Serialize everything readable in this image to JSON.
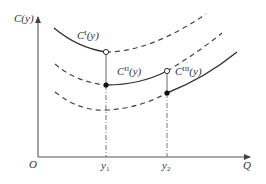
{
  "diagram": {
    "colors": {
      "axis": "#444444",
      "curve": "#333333",
      "background": "#ffffff"
    },
    "axes": {
      "y_label_main": "C",
      "y_label_arg": "(y)",
      "x_label": "Q",
      "origin_label": "O"
    },
    "ticks": [
      {
        "base": "y",
        "sub": "1"
      },
      {
        "base": "y",
        "sub": "2"
      }
    ],
    "curves": [
      {
        "base": "C",
        "sup": "I",
        "arg": "(y)"
      },
      {
        "base": "C",
        "sup": "II",
        "arg": "(y)"
      },
      {
        "base": "C",
        "sup": "III",
        "arg": "(y)"
      }
    ]
  }
}
